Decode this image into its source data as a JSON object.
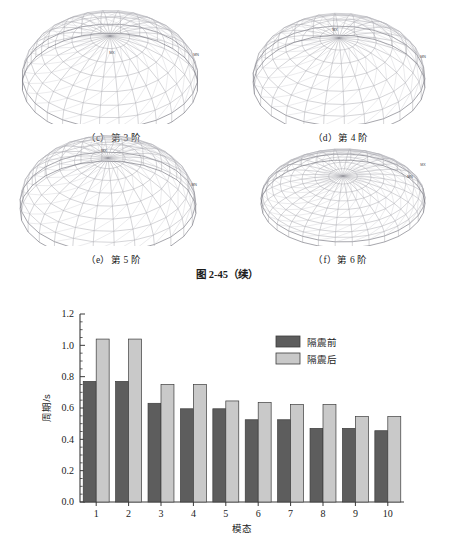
{
  "figure": {
    "caption": "图 2-45（续）",
    "subfigures": [
      {
        "id": "c",
        "caption": "（c）第 3 阶",
        "marker_max": "MX",
        "marker_min": "MN"
      },
      {
        "id": "d",
        "caption": "（d）第 4 阶",
        "marker_max": "MX",
        "marker_min": "MN"
      },
      {
        "id": "e",
        "caption": "（e）第 5 阶",
        "marker_max": "MX",
        "marker_min": "MN"
      },
      {
        "id": "f",
        "caption": "（f）第 6 阶",
        "marker_max": "MX",
        "marker_min": "MN"
      }
    ]
  },
  "chart_data": {
    "type": "bar",
    "title": "",
    "xlabel": "模态",
    "ylabel": "周期/s",
    "categories": [
      "1",
      "2",
      "3",
      "4",
      "5",
      "6",
      "7",
      "8",
      "9",
      "10"
    ],
    "ylim": [
      0.0,
      1.2
    ],
    "ytick_labels": [
      "0.0",
      "0.2",
      "0.4",
      "0.6",
      "0.8",
      "1.0",
      "1.2"
    ],
    "ytick_values": [
      0.0,
      0.2,
      0.4,
      0.6,
      0.8,
      1.0,
      1.2
    ],
    "ytick_minor_step": 0.05,
    "grid": false,
    "legend_position": "upper-right-inside",
    "series": [
      {
        "name": "隔震前",
        "color": "#5d5d5d",
        "values": [
          0.77,
          0.77,
          0.63,
          0.595,
          0.595,
          0.525,
          0.525,
          0.47,
          0.47,
          0.455
        ]
      },
      {
        "name": "隔震后",
        "color": "#c9c9c9",
        "values": [
          1.04,
          1.04,
          0.75,
          0.75,
          0.645,
          0.635,
          0.622,
          0.622,
          0.545,
          0.545
        ]
      }
    ]
  },
  "colors": {
    "series_before": "#5d5d5d",
    "series_after": "#c9c9c9",
    "axis": "#3a3a3a",
    "text": "#1b1b1b",
    "mesh": "#9a9aa2"
  }
}
